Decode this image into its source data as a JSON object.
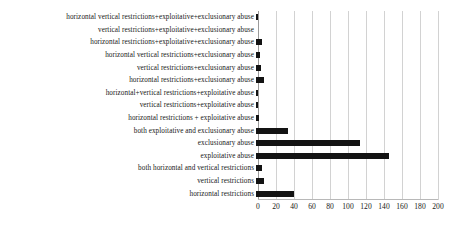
{
  "chart_data": {
    "type": "bar",
    "orientation": "horizontal",
    "title": "",
    "subtitle": "",
    "xlabel": "",
    "ylabel": "",
    "xlim": [
      0,
      200
    ],
    "ticks": [
      0,
      20,
      40,
      60,
      80,
      100,
      120,
      140,
      160,
      180,
      200
    ],
    "grid": true,
    "legend": false,
    "legend_position": "none",
    "bar_color": "#131313",
    "grid_color": "#d2d2d2",
    "axis_color": "#9a9a9a",
    "categories": [
      "horizontal vertical restrictions+exploitative+exclusionary abuse",
      "vertical restrictions+exploitative+exclusionary abuse",
      "horizontal restrictions+exploitative+exclusionary abuse",
      "horizontal vertical restrictions+exclusionary abuse",
      "vertical restrictions+exclusionary abuse",
      "horizontal restrictions+exclusionary abuse",
      "horizontal+vertical restrictions+exploitative abuse",
      "vertical restrictions+exploitative abuse",
      "horizontal restrictions + exploitative abuse",
      "both exploitative and exclusionary abuse",
      "exclusionary abuse",
      "exploitative abuse",
      "both horizontal and vertical restrictions",
      "vertical restrictions",
      "horizontal restrictions"
    ],
    "values": [
      2,
      0,
      7,
      4,
      5,
      9,
      2,
      2,
      3,
      36,
      116,
      148,
      7,
      9,
      42
    ]
  }
}
